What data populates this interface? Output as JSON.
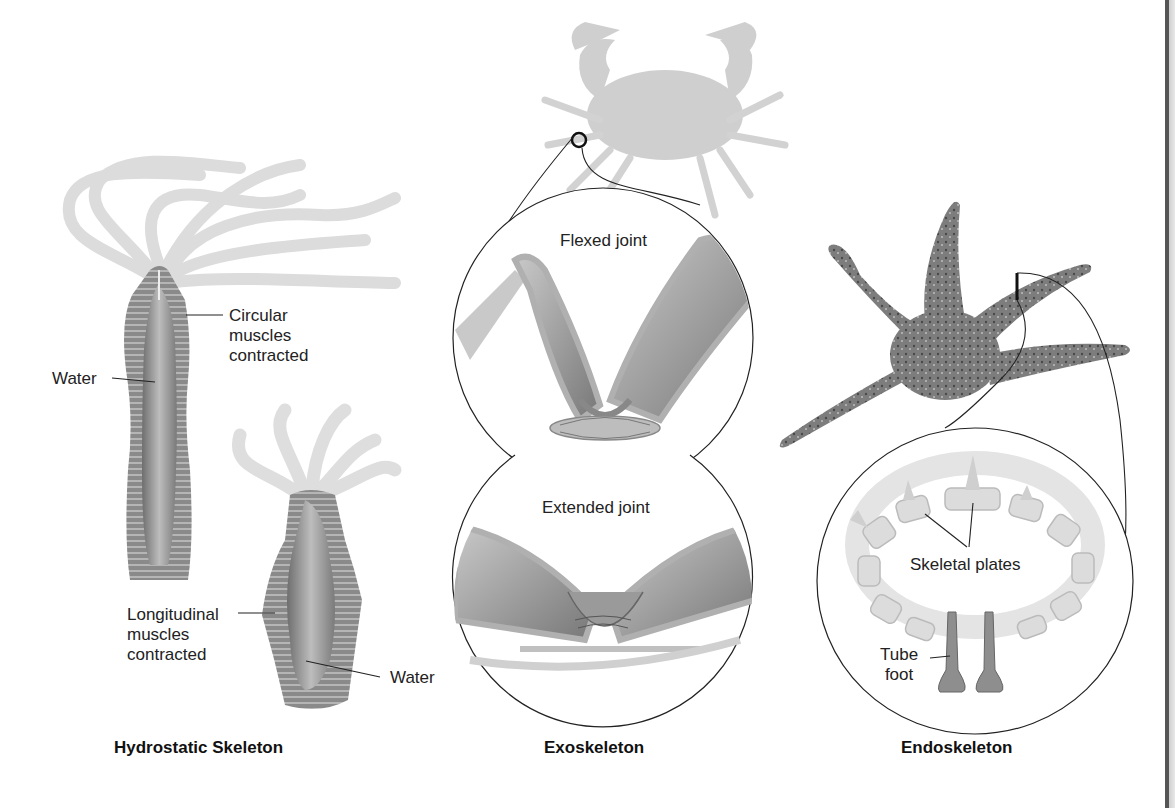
{
  "figure": {
    "panels": [
      {
        "id": "hydrostatic",
        "title": "Hydrostatic Skeleton",
        "labels": {
          "circular_muscles": "Circular\nmuscles\ncontracted",
          "water_top": "Water",
          "longitudinal_muscles": "Longitudinal\nmuscles\ncontracted",
          "water_bottom": "Water"
        },
        "organism": "hydra"
      },
      {
        "id": "exoskeleton",
        "title": "Exoskeleton",
        "labels": {
          "flexed": "Flexed joint",
          "extended": "Extended joint"
        },
        "organism": "crab"
      },
      {
        "id": "endoskeleton",
        "title": "Endoskeleton",
        "labels": {
          "plates": "Skeletal plates",
          "tube_foot": "Tube\nfoot"
        },
        "organism": "sea star"
      }
    ],
    "colors": {
      "ink": "#1a1a1a",
      "tissue_dark": "#7a7a7a",
      "tissue_mid": "#a8a8a8",
      "tissue_light": "#d6d6d6"
    }
  }
}
